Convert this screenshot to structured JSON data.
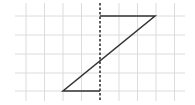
{
  "diagram": {
    "type": "grid-figure-reflection",
    "grid": {
      "color": "#dcdcdc",
      "vertical_lines_x": [
        26,
        44.5,
        63,
        81.5,
        119,
        137.5,
        156,
        174.5
      ],
      "horizontal_lines_y": [
        16,
        35,
        54,
        73,
        91
      ],
      "x_extent": [
        15,
        185
      ],
      "y_extent": [
        3,
        101
      ]
    },
    "axis": {
      "label": "line of symmetry",
      "style": "dashed",
      "color": "#333333",
      "x": 100,
      "y1": 3,
      "y2": 101
    },
    "figure": {
      "label": "Z-shaped polyline",
      "color": "#333333",
      "points": [
        [
          100,
          16
        ],
        [
          155,
          16
        ],
        [
          63,
          91
        ],
        [
          100,
          91
        ]
      ]
    }
  }
}
